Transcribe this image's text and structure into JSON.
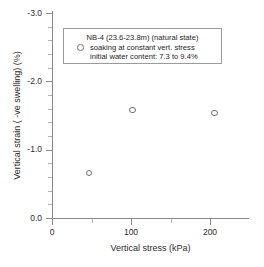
{
  "chart_data": {
    "type": "scatter",
    "title": "",
    "xlabel": "Vertical stress (kPa)",
    "ylabel": "Vertical strain ( -ve swelling) (%)",
    "xlim": [
      -20,
      230
    ],
    "ylim": [
      -3.0,
      0.0
    ],
    "y_axis_inverted": true,
    "grid": false,
    "xticks": [
      0,
      100,
      200
    ],
    "xtick_labels": [
      "0",
      "100",
      "200"
    ],
    "x_minor_ticks": [
      50,
      150
    ],
    "yticks": [
      -3.0,
      -2.0,
      -1.0,
      0.0
    ],
    "ytick_labels": [
      "-3.0",
      "-2.0",
      "-1.0",
      "0.0"
    ],
    "y_minor_ticks": [
      -2.8,
      -2.6,
      -2.4,
      -2.2,
      -1.8,
      -1.6,
      -1.4,
      -1.2,
      -0.8,
      -0.6,
      -0.4,
      -0.2
    ],
    "marker": "open-circle",
    "marker_color": "#6e6e6e",
    "series": [
      {
        "name": "NB-4 (23.6-23.8m) (natural state)",
        "points": [
          {
            "x": 47,
            "y": -0.66
          },
          {
            "x": 102,
            "y": -1.58
          },
          {
            "x": 206,
            "y": -1.54
          }
        ]
      }
    ],
    "legend": {
      "position": "upper-center",
      "lines": [
        "NB-4 (23.6-23.8m) (natural state)",
        "soaking at constant vert. stress",
        "initial water content: 7.3 to 9.4%"
      ]
    }
  }
}
